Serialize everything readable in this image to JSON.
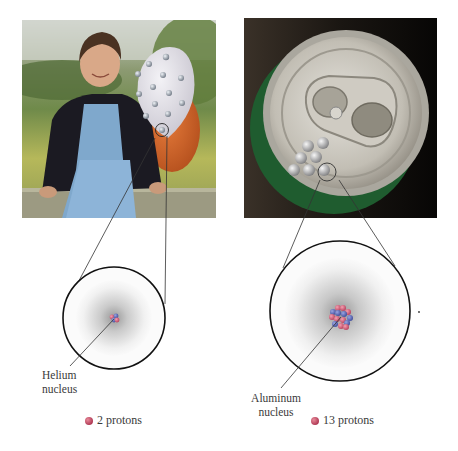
{
  "figure": {
    "left_panel": {
      "photo": "girl-with-helium-balloon",
      "atom_label_line1": "Helium",
      "atom_label_line2": "nucleus",
      "protons_label": "2 protons",
      "proton_count": 2
    },
    "right_panel": {
      "photo": "aluminum-can-top",
      "atom_label_line1": "Aluminum",
      "atom_label_line2": "nucleus",
      "protons_label": "13 protons",
      "proton_count": 13
    },
    "colors": {
      "proton": "#c0405e",
      "neutron": "#4a5aa8",
      "electron_cloud": "#9a9a9a",
      "balloon_white": "#e6e4ea",
      "balloon_orange": "#d2632a",
      "can_green": "#1f5c2f",
      "can_silver": "#c8c4bc"
    }
  }
}
